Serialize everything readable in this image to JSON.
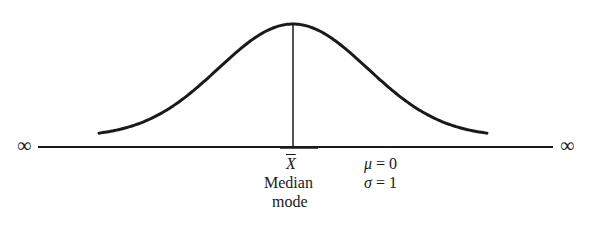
{
  "chart_data": {
    "type": "line",
    "title": "",
    "series": [
      {
        "name": "normal density",
        "x": [
          -3,
          -2.5,
          -2,
          -1.5,
          -1,
          -0.5,
          0,
          0.5,
          1,
          1.5,
          2,
          2.5,
          3
        ],
        "values": [
          0.0044,
          0.0175,
          0.054,
          0.1295,
          0.242,
          0.3521,
          0.3989,
          0.3521,
          0.242,
          0.1295,
          0.054,
          0.0175,
          0.0044
        ]
      }
    ],
    "annotations": [
      "X̄",
      "Median",
      "mode",
      "μ = 0",
      "σ = 1",
      "∞",
      "∞"
    ],
    "xlabel": "",
    "ylabel": "",
    "grid": false,
    "legend": "none"
  },
  "axis": {
    "left_end": "∞",
    "right_end": "∞"
  },
  "center_labels": {
    "mean": "X",
    "median": "Median",
    "mode": "mode"
  },
  "parameters": {
    "mu_symbol": "μ",
    "mu_value": "= 0",
    "sigma_symbol": "σ",
    "sigma_value": "= 1"
  },
  "colors": {
    "ink": "#1a1a1a",
    "background": "#ffffff"
  }
}
